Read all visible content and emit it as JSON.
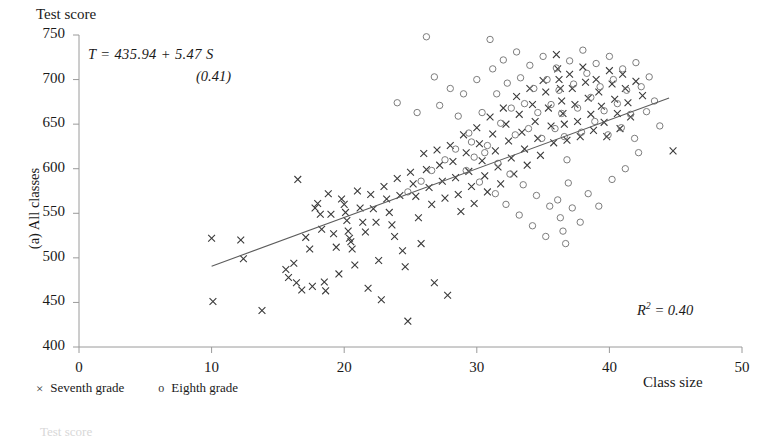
{
  "figure": {
    "panel_label": "(a) All classes",
    "title": "Test score",
    "x_axis_title": "Class size",
    "equation_main": "T =  435.94 +  5.47 S",
    "equation_se": "(0.41)",
    "r2_prefix": "R",
    "r2_exponent": "2",
    "r2_value": " = 0.40",
    "next_panel_hint": "Test score"
  },
  "legend": {
    "items": [
      {
        "marker": "×",
        "label": "Seventh grade",
        "marker_kind": "cross"
      },
      {
        "marker": "o",
        "label": "Eighth grade",
        "marker_kind": "circle"
      }
    ]
  },
  "chart_data": {
    "type": "scatter",
    "title": "Test score",
    "subtitle": "(a) All classes",
    "xlabel": "Class size",
    "ylabel": "Test score",
    "xlim": [
      0,
      50
    ],
    "ylim": [
      400,
      750
    ],
    "xticks": [
      0,
      10,
      20,
      30,
      40,
      50
    ],
    "yticks": [
      400,
      450,
      500,
      550,
      600,
      650,
      700,
      750
    ],
    "grid": false,
    "legend_position": "below-axis-left",
    "annotations": [
      {
        "text": "T =  435.94 +  5.47 S",
        "x": 5.5,
        "y": 733
      },
      {
        "text": "(0.41)",
        "x": 14.5,
        "y": 713
      },
      {
        "text": "R 2 = 0.40",
        "x": 38.5,
        "y": 443
      }
    ],
    "fit_line": {
      "type": "ols",
      "intercept": 435.94,
      "slope": 5.47,
      "se_slope": 0.41,
      "r_squared": 0.4,
      "x_start": 10.0,
      "x_end": 44.5,
      "y_start": 490.6,
      "y_end": 679.3
    },
    "series": [
      {
        "name": "Seventh grade",
        "marker": "x",
        "points": [
          [
            10.0,
            522
          ],
          [
            10.1,
            451
          ],
          [
            12.2,
            520
          ],
          [
            12.4,
            499
          ],
          [
            13.8,
            441
          ],
          [
            15.6,
            487
          ],
          [
            15.8,
            478
          ],
          [
            16.2,
            494
          ],
          [
            16.4,
            472
          ],
          [
            16.5,
            588
          ],
          [
            16.8,
            464
          ],
          [
            17.1,
            523
          ],
          [
            17.4,
            510
          ],
          [
            17.6,
            468
          ],
          [
            17.8,
            556
          ],
          [
            18.0,
            561
          ],
          [
            18.2,
            549
          ],
          [
            18.3,
            532
          ],
          [
            18.5,
            473
          ],
          [
            18.6,
            463
          ],
          [
            18.8,
            572
          ],
          [
            19.0,
            549
          ],
          [
            19.2,
            527
          ],
          [
            19.4,
            512
          ],
          [
            19.6,
            482
          ],
          [
            19.8,
            566
          ],
          [
            20.0,
            560
          ],
          [
            20.1,
            551
          ],
          [
            20.2,
            542
          ],
          [
            20.3,
            530
          ],
          [
            20.4,
            522
          ],
          [
            20.5,
            518
          ],
          [
            20.6,
            510
          ],
          [
            20.8,
            492
          ],
          [
            21.0,
            575
          ],
          [
            21.2,
            556
          ],
          [
            21.4,
            540
          ],
          [
            21.6,
            529
          ],
          [
            21.8,
            466
          ],
          [
            22.0,
            571
          ],
          [
            22.2,
            555
          ],
          [
            22.4,
            540
          ],
          [
            22.6,
            497
          ],
          [
            22.8,
            453
          ],
          [
            23.0,
            580
          ],
          [
            23.2,
            566
          ],
          [
            23.4,
            551
          ],
          [
            23.6,
            537
          ],
          [
            23.8,
            524
          ],
          [
            24.0,
            589
          ],
          [
            24.2,
            570
          ],
          [
            24.4,
            508
          ],
          [
            24.6,
            490
          ],
          [
            24.8,
            429
          ],
          [
            25.0,
            596
          ],
          [
            25.2,
            583
          ],
          [
            25.4,
            569
          ],
          [
            25.6,
            545
          ],
          [
            25.8,
            516
          ],
          [
            26.0,
            617
          ],
          [
            26.2,
            599
          ],
          [
            26.4,
            579
          ],
          [
            26.6,
            560
          ],
          [
            26.8,
            472
          ],
          [
            27.0,
            621
          ],
          [
            27.2,
            604
          ],
          [
            27.4,
            586
          ],
          [
            27.6,
            567
          ],
          [
            27.8,
            458
          ],
          [
            28.0,
            626
          ],
          [
            28.2,
            608
          ],
          [
            28.4,
            590
          ],
          [
            28.6,
            571
          ],
          [
            28.8,
            552
          ],
          [
            29.0,
            638
          ],
          [
            29.2,
            618
          ],
          [
            29.4,
            597
          ],
          [
            29.6,
            580
          ],
          [
            29.8,
            561
          ],
          [
            30.0,
            646
          ],
          [
            30.2,
            628
          ],
          [
            30.4,
            609
          ],
          [
            30.6,
            592
          ],
          [
            30.8,
            574
          ],
          [
            31.0,
            658
          ],
          [
            31.2,
            639
          ],
          [
            31.4,
            620
          ],
          [
            31.6,
            602
          ],
          [
            31.8,
            583
          ],
          [
            32.0,
            668
          ],
          [
            32.2,
            650
          ],
          [
            32.4,
            631
          ],
          [
            32.6,
            612
          ],
          [
            32.8,
            594
          ],
          [
            33.0,
            681
          ],
          [
            33.2,
            661
          ],
          [
            33.4,
            641
          ],
          [
            33.6,
            622
          ],
          [
            33.8,
            604
          ],
          [
            34.0,
            690
          ],
          [
            34.2,
            672
          ],
          [
            34.4,
            653
          ],
          [
            34.6,
            634
          ],
          [
            34.8,
            615
          ],
          [
            35.0,
            699
          ],
          [
            35.2,
            686
          ],
          [
            35.4,
            668
          ],
          [
            35.6,
            648
          ],
          [
            35.8,
            629
          ],
          [
            36.0,
            728
          ],
          [
            36.1,
            712
          ],
          [
            36.2,
            700
          ],
          [
            36.3,
            690
          ],
          [
            36.4,
            676
          ],
          [
            36.5,
            662
          ],
          [
            36.6,
            650
          ],
          [
            36.8,
            632
          ],
          [
            37.0,
            706
          ],
          [
            37.2,
            690
          ],
          [
            37.4,
            672
          ],
          [
            37.6,
            653
          ],
          [
            37.8,
            636
          ],
          [
            38.0,
            714
          ],
          [
            38.2,
            697
          ],
          [
            38.4,
            679
          ],
          [
            38.6,
            661
          ],
          [
            38.8,
            643
          ],
          [
            39.0,
            700
          ],
          [
            39.2,
            686
          ],
          [
            39.4,
            670
          ],
          [
            39.6,
            652
          ],
          [
            39.8,
            636
          ],
          [
            40.0,
            710
          ],
          [
            40.2,
            695
          ],
          [
            40.4,
            678
          ],
          [
            40.6,
            662
          ],
          [
            40.8,
            645
          ],
          [
            41.0,
            706
          ],
          [
            41.2,
            690
          ],
          [
            41.4,
            674
          ],
          [
            41.6,
            658
          ],
          [
            42.0,
            698
          ],
          [
            42.5,
            682
          ],
          [
            44.8,
            620
          ]
        ]
      },
      {
        "name": "Eighth grade",
        "marker": "o",
        "points": [
          [
            24.0,
            674
          ],
          [
            25.5,
            663
          ],
          [
            26.2,
            748
          ],
          [
            26.8,
            703
          ],
          [
            27.2,
            671
          ],
          [
            28.0,
            690
          ],
          [
            28.6,
            659
          ],
          [
            29.0,
            684
          ],
          [
            29.4,
            640
          ],
          [
            29.8,
            613
          ],
          [
            30.0,
            700
          ],
          [
            30.4,
            663
          ],
          [
            30.8,
            626
          ],
          [
            31.0,
            745
          ],
          [
            31.2,
            712
          ],
          [
            31.5,
            684
          ],
          [
            31.8,
            651
          ],
          [
            32.0,
            722
          ],
          [
            32.3,
            696
          ],
          [
            32.6,
            668
          ],
          [
            32.9,
            638
          ],
          [
            33.0,
            731
          ],
          [
            33.3,
            702
          ],
          [
            33.6,
            673
          ],
          [
            33.9,
            645
          ],
          [
            34.0,
            716
          ],
          [
            34.3,
            690
          ],
          [
            34.6,
            663
          ],
          [
            34.9,
            634
          ],
          [
            35.0,
            726
          ],
          [
            35.3,
            700
          ],
          [
            35.6,
            672
          ],
          [
            35.9,
            645
          ],
          [
            36.0,
            713
          ],
          [
            36.2,
            688
          ],
          [
            36.4,
            662
          ],
          [
            36.6,
            636
          ],
          [
            36.8,
            610
          ],
          [
            36.9,
            584
          ],
          [
            37.0,
            721
          ],
          [
            37.3,
            695
          ],
          [
            37.6,
            668
          ],
          [
            37.9,
            641
          ],
          [
            38.0,
            733
          ],
          [
            38.3,
            707
          ],
          [
            38.6,
            680
          ],
          [
            38.9,
            653
          ],
          [
            39.0,
            718
          ],
          [
            39.3,
            692
          ],
          [
            39.6,
            665
          ],
          [
            39.9,
            638
          ],
          [
            40.0,
            726
          ],
          [
            40.3,
            700
          ],
          [
            40.6,
            673
          ],
          [
            40.9,
            646
          ],
          [
            41.0,
            712
          ],
          [
            41.3,
            688
          ],
          [
            41.6,
            661
          ],
          [
            41.9,
            634
          ],
          [
            42.0,
            719
          ],
          [
            42.4,
            692
          ],
          [
            42.8,
            664
          ],
          [
            43.0,
            703
          ],
          [
            43.4,
            676
          ],
          [
            43.8,
            648
          ],
          [
            29.2,
            598
          ],
          [
            30.2,
            585
          ],
          [
            31.4,
            572
          ],
          [
            32.2,
            560
          ],
          [
            33.2,
            548
          ],
          [
            34.2,
            536
          ],
          [
            35.2,
            524
          ],
          [
            36.1,
            565
          ],
          [
            36.3,
            545
          ],
          [
            36.5,
            530
          ],
          [
            36.7,
            516
          ],
          [
            37.2,
            556
          ],
          [
            37.8,
            540
          ],
          [
            38.4,
            572
          ],
          [
            39.2,
            558
          ],
          [
            40.2,
            588
          ],
          [
            41.2,
            600
          ],
          [
            42.2,
            618
          ],
          [
            35.5,
            558
          ],
          [
            34.5,
            570
          ],
          [
            33.5,
            582
          ],
          [
            32.5,
            594
          ],
          [
            31.6,
            606
          ],
          [
            30.6,
            618
          ],
          [
            29.6,
            630
          ],
          [
            28.4,
            622
          ],
          [
            27.6,
            610
          ],
          [
            26.6,
            598
          ],
          [
            25.8,
            586
          ],
          [
            24.8,
            574
          ]
        ]
      }
    ]
  }
}
